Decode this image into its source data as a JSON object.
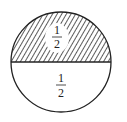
{
  "diagram": {
    "type": "fraction-circle",
    "parts": [
      {
        "region": "top",
        "shading": "hatched",
        "numerator": "1",
        "denominator": "2"
      },
      {
        "region": "bottom",
        "shading": "none",
        "numerator": "1",
        "denominator": "2"
      }
    ],
    "colors": {
      "stroke": "#222222",
      "hatch": "#333333",
      "background": "#ffffff"
    }
  }
}
